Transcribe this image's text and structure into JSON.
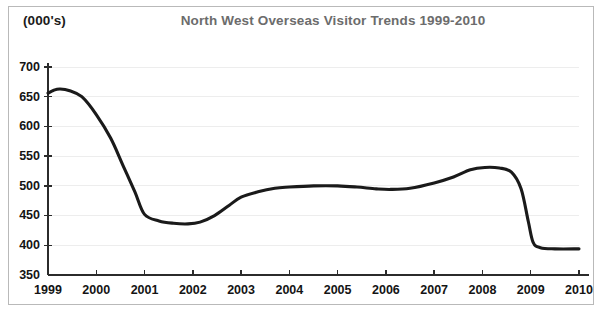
{
  "figure": {
    "units_label": "(000's)",
    "title": "North West Overseas Visitor Trends 1999-2010",
    "title_color": "#6c6c6c",
    "units_color": "#1b1b1b",
    "frame_border_color": "#b9b9b9",
    "background_color": "#ffffff"
  },
  "chart_data": {
    "type": "line",
    "title": "North West Overseas Visitor Trends 1999-2010",
    "subtitle": "",
    "xlabel": "",
    "ylabel": "(000's)",
    "unit_note": "(000's)",
    "xlim": [
      1999,
      2010
    ],
    "ylim": [
      350,
      700
    ],
    "grid": true,
    "grid_axis": "y",
    "legend": false,
    "legend_position": "none",
    "line_color": "#1a1a1a",
    "line_width": 3.1,
    "y_ticks": [
      350,
      400,
      450,
      500,
      550,
      600,
      650,
      700
    ],
    "y_tick_labels": [
      "350",
      "400",
      "450",
      "500",
      "550",
      "600",
      "650",
      "700"
    ],
    "x_ticks": [
      1999,
      2000,
      2001,
      2002,
      2003,
      2004,
      2005,
      2006,
      2007,
      2008,
      2009,
      2010
    ],
    "x_tick_labels": [
      "1999",
      "2000",
      "2001",
      "2002",
      "2003",
      "2004",
      "2005",
      "2006",
      "2007",
      "2008",
      "2009",
      "2010"
    ],
    "series": [
      {
        "name": "North West overseas visitors",
        "x": [
          1999,
          2000,
          2001,
          2002,
          2003,
          2004,
          2005,
          2006,
          2007,
          2008,
          2009,
          2010
        ],
        "values": [
          656,
          620,
          452,
          438,
          481,
          498,
          500,
          494,
          505,
          531,
          399,
          394
        ]
      }
    ],
    "x": [
      1999,
      2000,
      2001,
      2002,
      2003,
      2004,
      2005,
      2006,
      2007,
      2008,
      2009,
      2010
    ],
    "values": [
      656,
      620,
      452,
      438,
      481,
      498,
      500,
      494,
      505,
      531,
      399,
      394
    ],
    "curve_points": [
      [
        1999.0,
        656
      ],
      [
        1999.12,
        661
      ],
      [
        1999.25,
        663
      ],
      [
        1999.45,
        660
      ],
      [
        1999.7,
        650
      ],
      [
        2000.0,
        620
      ],
      [
        2000.3,
        580
      ],
      [
        2000.55,
        535
      ],
      [
        2000.8,
        490
      ],
      [
        2001.0,
        452
      ],
      [
        2001.3,
        441
      ],
      [
        2001.6,
        437
      ],
      [
        2001.9,
        436
      ],
      [
        2002.15,
        439
      ],
      [
        2002.45,
        450
      ],
      [
        2002.75,
        467
      ],
      [
        2003.0,
        481
      ],
      [
        2003.35,
        490
      ],
      [
        2003.7,
        496
      ],
      [
        2004.0,
        498
      ],
      [
        2004.5,
        500
      ],
      [
        2005.0,
        500
      ],
      [
        2005.4,
        498
      ],
      [
        2005.8,
        495
      ],
      [
        2006.1,
        494
      ],
      [
        2006.5,
        496
      ],
      [
        2007.0,
        505
      ],
      [
        2007.4,
        515
      ],
      [
        2007.75,
        527
      ],
      [
        2008.05,
        531
      ],
      [
        2008.35,
        530
      ],
      [
        2008.6,
        523
      ],
      [
        2008.8,
        495
      ],
      [
        2008.95,
        440
      ],
      [
        2009.05,
        405
      ],
      [
        2009.2,
        396
      ],
      [
        2009.5,
        394
      ],
      [
        2010.0,
        394
      ]
    ],
    "annotations": [
      {
        "text": "Peak 1999",
        "year": 1999,
        "value": 663
      },
      {
        "text": "Trough 2002",
        "year": 2002,
        "value": 436
      },
      {
        "text": "Peak 2008",
        "year": 2008,
        "value": 531
      },
      {
        "text": "Flat 2009-2010",
        "year": 2010,
        "value": 394
      }
    ]
  }
}
